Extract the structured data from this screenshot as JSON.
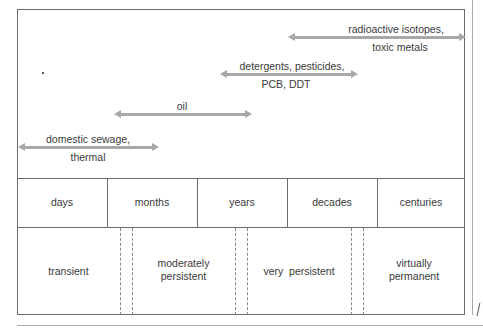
{
  "arrows": [
    {
      "label_line1": "radioactive isotopes,",
      "label_line2": "toxic metals"
    },
    {
      "label_line1": "detergents, pesticides,",
      "label_line2": "PCB, DDT"
    },
    {
      "label_line1": "oil",
      "label_line2": ""
    },
    {
      "label_line1": "domestic sewage,",
      "label_line2": "thermal"
    }
  ],
  "timescale": [
    "days",
    "months",
    "years",
    "decades",
    "centuries"
  ],
  "persistence": [
    {
      "line1": "transient",
      "line2": ""
    },
    {
      "line1": "moderately",
      "line2": "persistent"
    },
    {
      "line1": "very  persistent",
      "line2": ""
    },
    {
      "line1": "virtually",
      "line2": "permanent"
    }
  ],
  "colors": {
    "line": "#6a6a6a",
    "arrow": "#a8a8a8",
    "text": "#3a3a3a"
  }
}
